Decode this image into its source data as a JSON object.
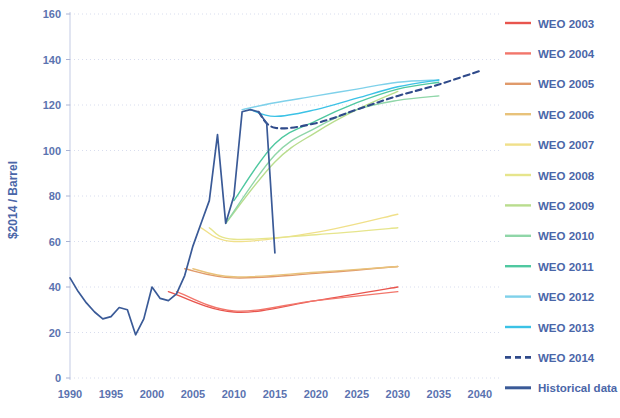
{
  "chart_data": {
    "type": "line",
    "title": "",
    "xlabel": "",
    "ylabel": "$2014 / Barrel",
    "xlim": [
      1990,
      2041
    ],
    "ylim": [
      0,
      160
    ],
    "grid": true,
    "legend_position": "right",
    "xticks": [
      "1990",
      "1995",
      "2000",
      "2005",
      "2010",
      "2015",
      "2020",
      "2025",
      "2030",
      "2035",
      "2040"
    ],
    "yticks": [
      "0",
      "20",
      "40",
      "60",
      "80",
      "100",
      "120",
      "140",
      "160"
    ],
    "series": [
      {
        "name": "WEO 2003",
        "color": "#e8554e",
        "dashed": false,
        "x": [
          2002,
          2010,
          2020,
          2030
        ],
        "values": [
          38,
          29,
          34,
          40
        ]
      },
      {
        "name": "WEO 2004",
        "color": "#f2766b",
        "dashed": false,
        "x": [
          2003,
          2010,
          2020,
          2030
        ],
        "values": [
          38,
          29.5,
          34,
          38
        ]
      },
      {
        "name": "WEO 2005",
        "color": "#e09a6b",
        "dashed": false,
        "x": [
          2004,
          2010,
          2020,
          2030
        ],
        "values": [
          48,
          44,
          46,
          49
        ]
      },
      {
        "name": "WEO 2006",
        "color": "#e8c27a",
        "dashed": false,
        "x": [
          2005,
          2010,
          2020,
          2030
        ],
        "values": [
          48,
          44.5,
          46.5,
          49
        ]
      },
      {
        "name": "WEO 2007",
        "color": "#f0e08a",
        "dashed": false,
        "x": [
          2006,
          2010,
          2020,
          2030
        ],
        "values": [
          66,
          60,
          64,
          72
        ]
      },
      {
        "name": "WEO 2008",
        "color": "#e6e58c",
        "dashed": false,
        "x": [
          2007,
          2010,
          2020,
          2030
        ],
        "values": [
          66,
          61,
          63,
          66
        ]
      },
      {
        "name": "WEO 2009",
        "color": "#b9dd8e",
        "dashed": false,
        "x": [
          2009,
          2015,
          2020,
          2025,
          2030
        ],
        "values": [
          68,
          95,
          108,
          118,
          126
        ]
      },
      {
        "name": "WEO 2010",
        "color": "#8fd6a8",
        "dashed": false,
        "x": [
          2009,
          2015,
          2020,
          2025,
          2030,
          2035
        ],
        "values": [
          68,
          98,
          110,
          118,
          122,
          124
        ]
      },
      {
        "name": "WEO 2011",
        "color": "#4fc8a0",
        "dashed": false,
        "x": [
          2010,
          2015,
          2020,
          2025,
          2030,
          2035
        ],
        "values": [
          78,
          103,
          113,
          121,
          127,
          130
        ]
      },
      {
        "name": "WEO 2012",
        "color": "#7fd1ea",
        "dashed": false,
        "x": [
          2011,
          2015,
          2020,
          2025,
          2030,
          2035
        ],
        "values": [
          118,
          121,
          124,
          127,
          130,
          131
        ]
      },
      {
        "name": "WEO 2013",
        "color": "#3bc2e6",
        "dashed": false,
        "x": [
          2012,
          2015,
          2020,
          2025,
          2030,
          2035
        ],
        "values": [
          118,
          115,
          118,
          123,
          128,
          131
        ]
      },
      {
        "name": "WEO 2014",
        "color": "#2f4a8a",
        "dashed": true,
        "x": [
          2013,
          2015,
          2020,
          2025,
          2030,
          2035,
          2040
        ],
        "values": [
          117,
          110,
          112,
          118,
          124,
          129,
          135
        ]
      },
      {
        "name": "Historical data",
        "color": "#3a5a97",
        "dashed": false,
        "x": [
          1990,
          1991,
          1992,
          1993,
          1994,
          1995,
          1996,
          1997,
          1998,
          1999,
          2000,
          2001,
          2002,
          2003,
          2004,
          2005,
          2006,
          2007,
          2008,
          2009,
          2010,
          2011,
          2012,
          2013,
          2014,
          2015
        ],
        "values": [
          44,
          38,
          33,
          29,
          26,
          27,
          31,
          30,
          19,
          26,
          40,
          35,
          34,
          37,
          45,
          58,
          68,
          78,
          107,
          68,
          80,
          117,
          118,
          117,
          112,
          55
        ]
      }
    ]
  },
  "legend": {
    "items": [
      {
        "label": "WEO 2003"
      },
      {
        "label": "WEO 2004"
      },
      {
        "label": "WEO 2005"
      },
      {
        "label": "WEO 2006"
      },
      {
        "label": "WEO 2007"
      },
      {
        "label": "WEO 2008"
      },
      {
        "label": "WEO 2009"
      },
      {
        "label": "WEO 2010"
      },
      {
        "label": "WEO 2011"
      },
      {
        "label": "WEO 2012"
      },
      {
        "label": "WEO 2013"
      },
      {
        "label": "WEO 2014"
      },
      {
        "label": "Historical data"
      }
    ]
  }
}
